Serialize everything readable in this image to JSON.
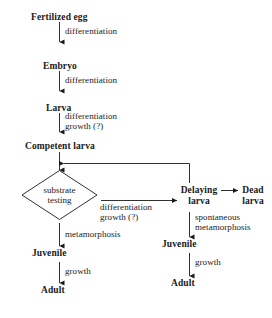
{
  "diagram": {
    "stroke_color": "#1a1a1a",
    "background_color": "#ffffff",
    "nodes": {
      "fertilized_egg": "Fertilized egg",
      "embryo": "Embryo",
      "larva": "Larva",
      "competent_larva": "Competent larva",
      "substrate_testing_line1": "substrate",
      "substrate_testing_line2": "testing",
      "delaying_larva_line1": "Delaying",
      "delaying_larva_line2": "larva",
      "dead_larva_line1": "Dead",
      "dead_larva_line2": "larva",
      "juvenile_left": "Juvenile",
      "adult_left": "Adult",
      "juvenile_right": "Juvenile",
      "adult_right": "Adult"
    },
    "edge_labels": {
      "egg_to_embryo": "differentiation",
      "embryo_to_larva": "differentiation",
      "larva_to_competent_line1": "differentiation",
      "larva_to_competent_line2": "growth (?)",
      "testing_to_delaying_line1": "differentiation",
      "testing_to_delaying_line2": "growth (?)",
      "testing_to_juvenile": "metamorphosis",
      "juvenile_to_adult_left": "growth",
      "delaying_to_juvenile_line1": "spontaneous",
      "delaying_to_juvenile_line2": "metamorphosis",
      "juvenile_to_adult_right": "growth"
    }
  }
}
